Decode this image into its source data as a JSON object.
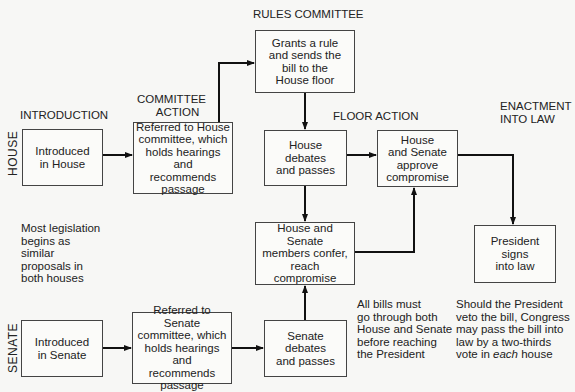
{
  "stage_headers": {
    "introduction": "INTRODUCTION",
    "committee_action_1": "COMMITTEE",
    "committee_action_2": "ACTION",
    "rules_committee": "RULES COMMITTEE",
    "floor_action": "FLOOR ACTION",
    "enactment_1": "ENACTMENT",
    "enactment_2": "INTO LAW"
  },
  "row_labels": {
    "house": "HOUSE",
    "senate": "SENATE"
  },
  "boxes": {
    "introduced_house": "Introduced\nin House",
    "house_committee": "Referred to House\ncommittee, which\nholds hearings and\nrecommends\npassage",
    "rules_grant": "Grants a rule\nand sends the\nbill to the\nHouse floor",
    "house_debates": "House debates\nand passes",
    "approve_compromise": "House\nand Senate\napprove\ncompromise",
    "conference": "House and Senate\nmembers confer,\nreach compromise",
    "president_signs": "President\nsigns\ninto law",
    "introduced_senate": "Introduced\nin Senate",
    "senate_committee": "Referred to Senate\ncommittee, which\nholds hearings and\nrecommends\npassage",
    "senate_debates": "Senate debates\nand passes"
  },
  "notes": {
    "similar_proposals": "Most legislation\nbegins as\nsimilar\nproposals in\nboth houses",
    "both_houses": "All bills must\ngo through both\nHouse and Senate\nbefore reaching\nthe President",
    "veto_pre": "Should the President\nveto the bill, Congress\nmay pass the bill into\nlaw by a two-thirds\nvote in ",
    "veto_em": "each",
    "veto_post": " house"
  }
}
